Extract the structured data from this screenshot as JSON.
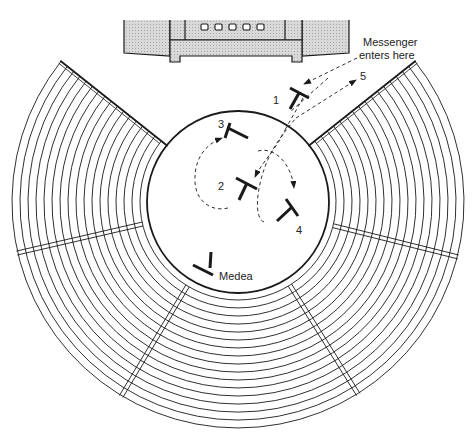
{
  "diagram": {
    "colors": {
      "ink": "#1a1a1a",
      "skene_fill": "#d6d6d6",
      "background": "#ffffff"
    },
    "skene": {
      "name": "stage building",
      "door_count": 5
    },
    "orchestra": {
      "name": "orchestra"
    },
    "seating": {
      "name": "theatron",
      "row_count": 17,
      "wedge_count": 5
    },
    "annotation": {
      "line1": "Messenger",
      "line2": "enters here"
    },
    "figures": [
      {
        "id": "1",
        "label": "1",
        "role": "messenger position 1"
      },
      {
        "id": "2",
        "label": "2",
        "role": "messenger position 2"
      },
      {
        "id": "3",
        "label": "3",
        "role": "messenger position 3"
      },
      {
        "id": "4",
        "label": "4",
        "role": "messenger position 4"
      },
      {
        "id": "5",
        "label": "5",
        "role": "messenger exit"
      },
      {
        "id": "medea",
        "label": "Medea",
        "role": "Medea"
      }
    ],
    "path_sequence": [
      "enter",
      "1",
      "3",
      "2",
      "4",
      "5"
    ]
  }
}
